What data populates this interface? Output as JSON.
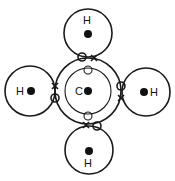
{
  "diagram": {
    "title": "",
    "molecule": "methane covalent bonding (electron shell model)",
    "colors": {
      "stroke": "#1a1a1a",
      "background": "#ffffff",
      "nucleus": "#111111"
    },
    "atoms": [
      {
        "id": "carbon",
        "label": "C",
        "cx": 88,
        "cy": 91,
        "r_outer": 33,
        "r_inner": 23
      },
      {
        "id": "h-top",
        "label": "H",
        "cx": 88,
        "cy": 33,
        "r": 24
      },
      {
        "id": "h-left",
        "label": "H",
        "cx": 30,
        "cy": 91,
        "r": 25
      },
      {
        "id": "h-right",
        "label": "H",
        "cx": 146,
        "cy": 92,
        "r": 24
      },
      {
        "id": "h-bottom",
        "label": "H",
        "cx": 89,
        "cy": 150,
        "r": 24
      }
    ],
    "electron_legend": {
      "open_circle": "electron from carbon",
      "cross": "electron from hydrogen"
    }
  }
}
